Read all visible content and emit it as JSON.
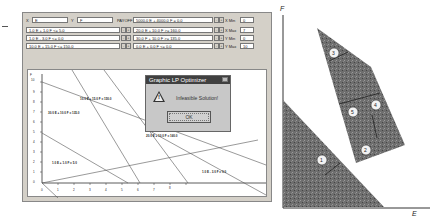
{
  "app": {
    "title": "Graphic LP Optimizer"
  },
  "inputs": {
    "x_label": "X",
    "x_value": "E",
    "y_label": "Y",
    "y_value": "F",
    "objective_label": "PAYOFF",
    "objective": "5000.0 E + 4000.0 F = 0.0"
  },
  "constraints": [
    "1.0 E + 1.0 F <= 5.0",
    "1.0 E - 3.0 F <= 0.0",
    "10.0 E + 15.0 F <= 150.0",
    "20.0 E + 10.0 F >= 160.0",
    "30.0 F + 10.0 F >= 135.0",
    "0.0 E + 0.0 F <= 0.0"
  ],
  "axis_limits": [
    {
      "label": "X Min",
      "value": "0"
    },
    {
      "label": "X Max",
      "value": "7"
    },
    {
      "label": "Y Min",
      "value": "0"
    },
    {
      "label": "Y Max",
      "value": "10"
    }
  ],
  "plot": {
    "y_axis_label": "F",
    "y_ticks": [
      "10",
      "9",
      "8",
      "7",
      "6",
      "5",
      "4",
      "3",
      "2",
      "1",
      "0"
    ],
    "x_ticks": [
      "0",
      "1",
      "2",
      "3",
      "4",
      "5",
      "6",
      "7",
      "8"
    ],
    "line_labels": [
      "10.0 E + 15.0 F = 150.0",
      "30.0 E + 10.0 F = 135.0",
      "1.0 E + 1.0 F = 5.0",
      "20.0 E + 10.0 F = 160.0",
      "1.0 E - 3.0 F = 0.0"
    ]
  },
  "dialog": {
    "title": "Graphic LP Optimizer",
    "message": "Infeasible Solution!",
    "ok_label": "OK"
  },
  "figure": {
    "y_axis": "F",
    "x_axis": "E",
    "markers": [
      "1",
      "2",
      "3",
      "4",
      "5"
    ]
  }
}
